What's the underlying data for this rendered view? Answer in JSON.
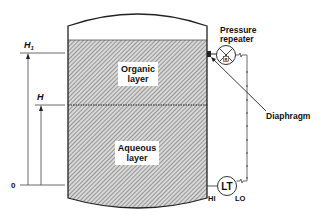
{
  "diagram": {
    "tank": {
      "layers": [
        {
          "id": "organic",
          "label_line1": "Organic",
          "label_line2": "layer"
        },
        {
          "id": "aqueous",
          "label_line1": "Aqueous",
          "label_line2": "layer"
        }
      ]
    },
    "levels": {
      "h1": "H",
      "h1_sub": "1",
      "h": "H",
      "zero": "0"
    },
    "instruments": {
      "pressure_repeater_line1": "Pressure",
      "pressure_repeater_line2": "repeater",
      "repeater_symbol": "R",
      "diaphragm": "Diaphragm",
      "transmitter": "LT",
      "hi": "HI",
      "lo": "LO"
    },
    "colors": {
      "line": "#222222",
      "hatch": "#888888",
      "background": "#ffffff"
    }
  }
}
